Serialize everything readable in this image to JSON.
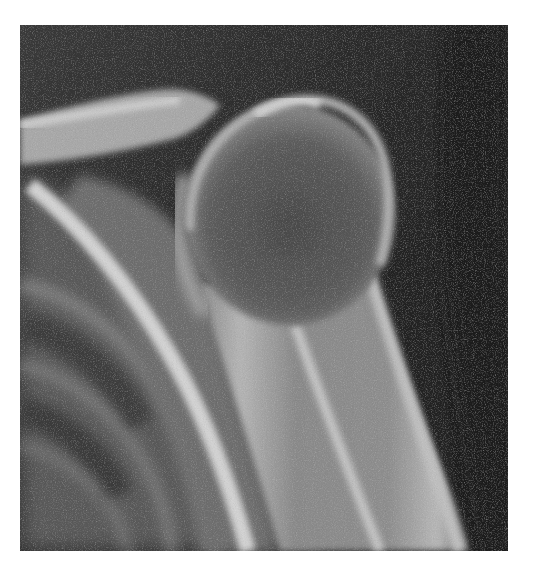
{
  "image": {
    "kind": "radiograph",
    "subject": "shoulder-xray",
    "modality": "X-ray",
    "colors": {
      "page_background": "#ffffff",
      "film_background": "#2a2a2a",
      "bone_highlight": "#d8d8d8",
      "soft_tissue": "#7a7a7a"
    },
    "frame": {
      "left": 20,
      "top": 25,
      "width": 488,
      "height": 526
    }
  }
}
